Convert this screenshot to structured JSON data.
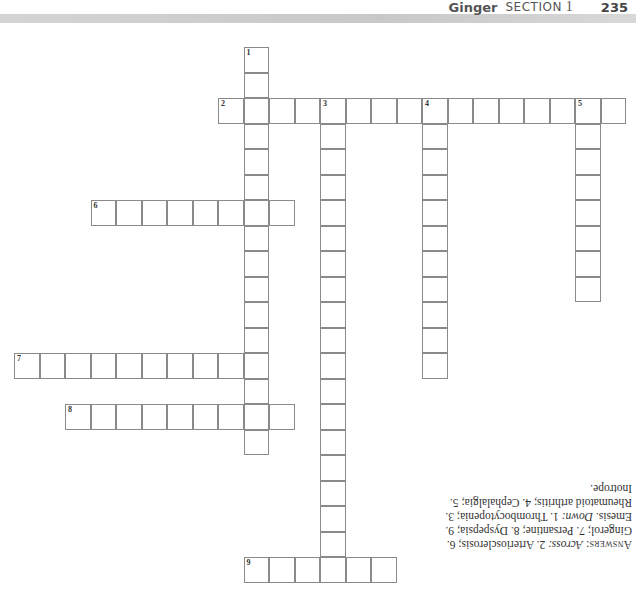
{
  "header": {
    "chapter": "Ginger",
    "section_label": "SECTION",
    "section_number": "1",
    "page_number": "235"
  },
  "crossword": {
    "cell_size": 25.5,
    "origin": {
      "x": 14,
      "y": 47
    },
    "entries": [
      {
        "number": "1",
        "direction": "down",
        "row": 0,
        "col": 9,
        "length": 16
      },
      {
        "number": "2",
        "direction": "across",
        "row": 2,
        "col": 8,
        "length": 16
      },
      {
        "number": "3",
        "direction": "down",
        "row": 2,
        "col": 12,
        "length": 19
      },
      {
        "number": "4",
        "direction": "down",
        "row": 2,
        "col": 16,
        "length": 11
      },
      {
        "number": "5",
        "direction": "down",
        "row": 2,
        "col": 22,
        "length": 8
      },
      {
        "number": "6",
        "direction": "across",
        "row": 6,
        "col": 3,
        "length": 8
      },
      {
        "number": "7",
        "direction": "across",
        "row": 12,
        "col": 0,
        "length": 10
      },
      {
        "number": "8",
        "direction": "across",
        "row": 14,
        "col": 2,
        "length": 9
      },
      {
        "number": "9",
        "direction": "across",
        "row": 20,
        "col": 9,
        "length": 6
      }
    ]
  },
  "answers": {
    "label": "Answers:",
    "across_label": "Across:",
    "across_text": "2. Arteriosclerosis; 6. Gingerol; 7. Persantine; 8. Dyspepsia; 9. Emesis.",
    "down_label": "Down:",
    "down_text": "1. Thrombocytopenia; 3. Rheumatoid arthritis; 4. Cephalalgia; 5. Inotrope."
  }
}
